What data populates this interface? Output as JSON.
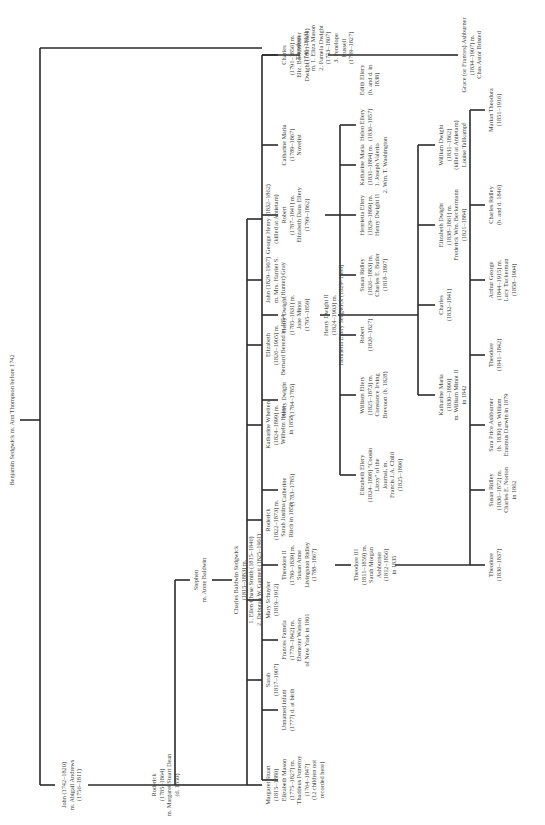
{
  "line_color": "#2a2a2a",
  "text_color": "#444444",
  "root": {
    "lines": [
      "Benjamin Sedgwick   m. Ann Thompson before 1742"
    ]
  },
  "gen1": {
    "john": {
      "lines": [
        "John (1742–1820)",
        "m. Abigail Andrews",
        "(1756–1811)"
      ]
    },
    "theodore": {
      "lines": [
        "Theodore",
        "(1746–1813)",
        "m. 1. Eliza Mason",
        "2. Pamela Dwight",
        "(1753–1807)",
        "3. Penelope",
        "Russell",
        "(1769–1827)"
      ]
    }
  },
  "john_children": {
    "roderick": {
      "lines": [
        "Roderick",
        "(1785–1864)",
        "m. Margaret Stuart Dean",
        "(d. 1850)"
      ]
    },
    "stephen": {
      "lines": [
        "Stephen",
        "m. Anne Baldwin"
      ]
    }
  },
  "stephen_children": {
    "charles_baldwin": {
      "lines": [
        "Charles Baldwin Sedgwick",
        "(1815–1883) m.",
        "1. Ellen Chase Smith (1815–1846)",
        "2. Deborah W. Gannett (1825–1901)"
      ]
    }
  },
  "roderick_children": [
    {
      "lines": [
        "Margaret Stuart",
        "(1815–1880)"
      ]
    },
    {
      "lines": [
        "Sarah",
        "(1817–1907)"
      ]
    },
    {
      "lines": [
        "Mary Schuyler",
        "(1819–1912)"
      ]
    },
    {
      "lines": [
        "Roderick",
        "(1822–1873) m.",
        "Sarah Justina",
        "Ritch in 1858"
      ]
    },
    {
      "lines": [
        "Katharine Whetten",
        "(1824–1899) m.",
        "Wilhelm Heine",
        "in 1858"
      ]
    },
    {
      "lines": [
        "Elizabeth",
        "(1826–1905) m.",
        "Bernard Berend in 1854"
      ]
    },
    {
      "lines": [
        "John (1829–1907)",
        "m. Mrs. Harriet S.",
        "(Hunter) Gray"
      ]
    },
    {
      "lines": [
        "George Henry (1832–1862)",
        "(killed at Antietam)"
      ]
    }
  ],
  "theodore_children": [
    {
      "lines": [
        "Elizabeth Mason",
        "(1775–1827) m.",
        "Thaddeus Pomeroy",
        "(1764–1847)",
        "(12 children not",
        "recorded here)"
      ]
    },
    {
      "lines": [
        "Unnamed infant",
        "(1777) d. at birth"
      ]
    },
    {
      "lines": [
        "Frances Pamela",
        "(1778–1842) m.",
        "Ebenezer Watson",
        "of New York in 1801"
      ]
    },
    {
      "lines": [
        "Theodore II",
        "(1780–1839) m.",
        "Susan Anne",
        "Livingston Ridley",
        "(1788–1867)"
      ]
    },
    {
      "lines": [
        "Catherine",
        "(1783–1785)"
      ]
    },
    {
      "lines": [
        "Henry Dwight",
        "(1784–1785)"
      ]
    },
    {
      "lines": [
        "Henry Dwight",
        "(1785–1831) m.",
        "Jane Minot",
        "(1795–1859)"
      ]
    },
    {
      "lines": [
        "Robert",
        "(1787–1841) m.",
        "Elizabeth Dana Ellery",
        "(1799–1862)"
      ]
    },
    {
      "lines": [
        "Catharine Maria",
        "(1789–1867)",
        "Novelist"
      ]
    },
    {
      "lines": [
        "Charles",
        "(1791–1856) m.",
        "Eliz. Buckminster",
        "Dwight (1801–1864)"
      ]
    }
  ],
  "henry_dwight_child": {
    "lines": [
      "Henry Dwight II",
      "(1824–1903) m.",
      "Henrietta Ellery Sedgwick (1829–1899)"
    ]
  },
  "charles_child": {
    "lines": [
      "Grace (or Frances) Ashburner",
      "(1834–1907) m.",
      "Chas Astor Bristed"
    ]
  },
  "theodore3": {
    "lines": [
      "Theodore III",
      "(1811–1859) m.",
      "Sarah Morgan",
      "Ashburner",
      "(1812–1856)",
      "in 1835"
    ]
  },
  "robert_children": [
    {
      "lines": [
        "Elizabeth Ellery",
        "(1824–1898) \"Cousin",
        "Lizzy\" of the",
        "Journal, m.",
        "Francis J.A. Child",
        "(1825–1896)"
      ]
    },
    {
      "lines": [
        "William Ellery",
        "(1825–1873) m.",
        "Constance Irving",
        "Brevoort (b. 1828)"
      ]
    },
    {
      "lines": [
        "Robert",
        "(1826–1827)"
      ]
    },
    {
      "lines": [
        "Susan Ridley",
        "(1826–1883) m.",
        "Charles E. Butler",
        "(1818–1897)"
      ]
    },
    {
      "lines": [
        "Henrietta Ellery",
        "(1829–1899) m.",
        "Henry Dwight II"
      ]
    },
    {
      "lines": [
        "Katharine Maria",
        "(1831–1884) m.",
        "1. Joseph Valerio",
        "2. Wm. T. Washington"
      ]
    },
    {
      "lines": [
        "Helen Ellery",
        "(1836–1857)"
      ]
    },
    {
      "lines": [
        "Edith Ellery",
        "(b. and d. in",
        "1838)"
      ]
    }
  ],
  "henry_dwight_children": [
    {
      "lines": [
        "Katharine Maria",
        "(1830–1890)",
        "m. William Minot II",
        "in 1842"
      ]
    },
    {
      "lines": [
        "Charles",
        "(1832–1841)"
      ]
    },
    {
      "lines": [
        "Elizabeth Dwight",
        "(1838–1861) m.",
        "Frederick Wm. Beckermann",
        "(1821–1884)"
      ]
    },
    {
      "lines": [
        "William Dwight",
        "(1831–1862)",
        "(killed at Antietam)",
        "Louise Tallkampf"
      ]
    }
  ],
  "theodore3_children": [
    {
      "lines": [
        "Theodore",
        "(1836–1837)"
      ]
    },
    {
      "lines": [
        "Susan Ridley",
        "(1836–1872) m.",
        "Charles E. Norton",
        "in 1862"
      ]
    },
    {
      "lines": [
        "Sara Price Ashburner",
        "(b. 1839) m. William",
        "Erasmus Darwin in 1879"
      ]
    },
    {
      "lines": [
        "Theodore",
        "(1841–1842)"
      ]
    },
    {
      "lines": [
        "Arthur George",
        "(1844–1915) m.",
        "Lucy Tuckerman",
        "(1858–1904)"
      ]
    },
    {
      "lines": [
        "Charles Ridley",
        "(b. and d. 1846)"
      ]
    },
    {
      "lines": [
        "Marian Theodora",
        "(1851–1916)"
      ]
    }
  ]
}
